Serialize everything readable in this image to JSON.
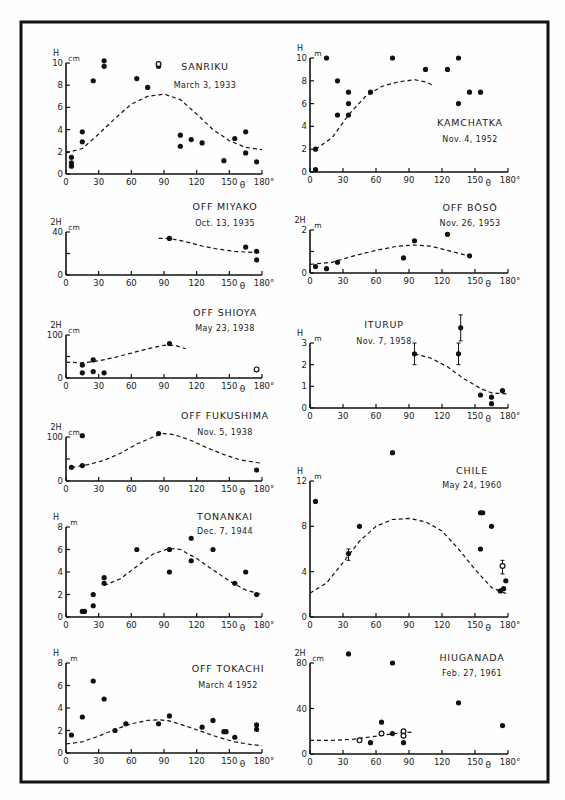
{
  "figure": {
    "frame": true,
    "x_axis_symbol": "θ",
    "x_ticks": [
      0,
      30,
      60,
      90,
      120,
      150,
      180
    ],
    "x_tick_labels": [
      "0",
      "30",
      "60",
      "90",
      "120",
      "150",
      "180°"
    ]
  },
  "chart_data": [
    {
      "type": "scatter",
      "title": "SANRIKU",
      "subtitle": "March 3, 1933",
      "ylabel": "H",
      "yunit": "cm",
      "xlabel": "θ",
      "xlim": [
        0,
        180
      ],
      "ylim": [
        0,
        10
      ],
      "yticks": [
        0,
        2,
        4,
        6,
        8,
        10
      ],
      "points": [
        [
          5,
          0.7
        ],
        [
          5,
          1
        ],
        [
          5,
          1.5
        ],
        [
          15,
          2.9
        ],
        [
          15,
          3.8
        ],
        [
          25,
          8.4
        ],
        [
          35,
          9.7
        ],
        [
          35,
          10.2
        ],
        [
          65,
          8.6
        ],
        [
          75,
          7.8
        ],
        [
          85,
          9.7
        ],
        [
          105,
          2.5
        ],
        [
          105,
          3.5
        ],
        [
          115,
          3.1
        ],
        [
          125,
          2.8
        ],
        [
          145,
          1.2
        ],
        [
          155,
          3.2
        ],
        [
          165,
          1.9
        ],
        [
          165,
          3.8
        ],
        [
          175,
          1.1
        ]
      ],
      "open_points": [
        [
          85,
          9.9
        ]
      ],
      "curve": [
        [
          0,
          1.9
        ],
        [
          15,
          2.3
        ],
        [
          30,
          3.6
        ],
        [
          45,
          5.0
        ],
        [
          60,
          6.3
        ],
        [
          75,
          7.0
        ],
        [
          90,
          7.2
        ],
        [
          105,
          6.7
        ],
        [
          120,
          5.4
        ],
        [
          135,
          4.0
        ],
        [
          150,
          3.0
        ],
        [
          165,
          2.4
        ],
        [
          180,
          2.2
        ]
      ]
    },
    {
      "type": "scatter",
      "title": "KAMCHATKA",
      "subtitle": "Nov. 4, 1952",
      "ylabel": "H",
      "yunit": "m",
      "xlabel": "θ",
      "xlim": [
        0,
        180
      ],
      "ylim": [
        0,
        10
      ],
      "yticks": [
        0,
        2,
        4,
        6,
        8,
        10
      ],
      "points": [
        [
          5,
          0.2
        ],
        [
          5,
          2
        ],
        [
          15,
          10
        ],
        [
          25,
          5
        ],
        [
          25,
          8
        ],
        [
          35,
          5
        ],
        [
          35,
          6
        ],
        [
          35,
          7
        ],
        [
          55,
          7
        ],
        [
          75,
          10
        ],
        [
          105,
          9
        ],
        [
          125,
          9
        ],
        [
          135,
          6
        ],
        [
          135,
          10
        ],
        [
          145,
          7
        ],
        [
          155,
          7
        ]
      ],
      "curve": [
        [
          5,
          2
        ],
        [
          20,
          3.0
        ],
        [
          35,
          5.0
        ],
        [
          50,
          6.6
        ],
        [
          65,
          7.5
        ],
        [
          80,
          7.9
        ],
        [
          95,
          8.1
        ],
        [
          105,
          7.9
        ],
        [
          112,
          7.6
        ]
      ]
    },
    {
      "type": "scatter",
      "title": "OFF MIYAKO",
      "subtitle": "Oct. 13, 1935",
      "ylabel": "2H",
      "yunit": "cm",
      "xlabel": "θ",
      "xlim": [
        0,
        180
      ],
      "ylim": [
        0,
        40
      ],
      "yticks": [
        0,
        20,
        40
      ],
      "ytick_labels": [
        "0",
        "",
        "40"
      ],
      "points": [
        [
          95,
          34
        ],
        [
          165,
          26
        ],
        [
          175,
          22
        ],
        [
          175,
          14
        ]
      ],
      "curve": [
        [
          85,
          34
        ],
        [
          95,
          34
        ],
        [
          110,
          31
        ],
        [
          125,
          27
        ],
        [
          140,
          24
        ],
        [
          155,
          22
        ],
        [
          170,
          21
        ],
        [
          180,
          21
        ]
      ]
    },
    {
      "type": "scatter",
      "title": "OFF BŌSŌ",
      "subtitle": "Nov. 26, 1953",
      "ylabel": "2H",
      "yunit": "m",
      "xlabel": "θ",
      "xlim": [
        0,
        180
      ],
      "ylim": [
        0,
        2
      ],
      "yticks": [
        0,
        1,
        2
      ],
      "ytick_labels": [
        "0",
        "",
        "2"
      ],
      "points": [
        [
          5,
          0.3
        ],
        [
          15,
          0.2
        ],
        [
          25,
          0.5
        ],
        [
          85,
          0.7
        ],
        [
          95,
          1.5
        ],
        [
          125,
          1.8
        ],
        [
          145,
          0.8
        ]
      ],
      "curve": [
        [
          0,
          0.4
        ],
        [
          20,
          0.5
        ],
        [
          40,
          0.8
        ],
        [
          60,
          1.05
        ],
        [
          80,
          1.25
        ],
        [
          95,
          1.3
        ],
        [
          110,
          1.25
        ],
        [
          125,
          1.05
        ],
        [
          140,
          0.85
        ],
        [
          145,
          0.8
        ]
      ]
    },
    {
      "type": "scatter",
      "title": "OFF SHIOYA",
      "subtitle": "May 23, 1938",
      "ylabel": "2H",
      "yunit": "cm",
      "xlabel": "θ",
      "xlim": [
        0,
        180
      ],
      "ylim": [
        0,
        100
      ],
      "yticks": [
        0,
        50,
        100
      ],
      "ytick_labels": [
        "0",
        "",
        "100"
      ],
      "points": [
        [
          15,
          12
        ],
        [
          15,
          30
        ],
        [
          25,
          42
        ],
        [
          25,
          15
        ],
        [
          35,
          12
        ],
        [
          95,
          80
        ]
      ],
      "open_points": [
        [
          175,
          20
        ]
      ],
      "curve": [
        [
          0,
          37
        ],
        [
          15,
          35
        ],
        [
          30,
          40
        ],
        [
          45,
          48
        ],
        [
          60,
          58
        ],
        [
          75,
          68
        ],
        [
          90,
          76
        ],
        [
          100,
          76
        ],
        [
          110,
          68
        ]
      ]
    },
    {
      "type": "scatter",
      "title": "ITURUP",
      "subtitle": "Nov. 7, 1958",
      "ylabel": "H",
      "yunit": "m",
      "xlabel": "θ",
      "xlim": [
        0,
        180
      ],
      "ylim": [
        0,
        3
      ],
      "yticks": [
        0,
        1,
        2,
        3
      ],
      "points": [
        [
          95,
          2.5
        ],
        [
          135,
          2.5
        ],
        [
          137,
          3.7
        ],
        [
          155,
          0.6
        ],
        [
          165,
          0.5
        ],
        [
          165,
          0.2
        ],
        [
          175,
          0.8
        ]
      ],
      "error_bars": [
        [
          95,
          2.0,
          3.0
        ],
        [
          135,
          2.0,
          3.0
        ],
        [
          137,
          3.1,
          4.3
        ]
      ],
      "curve": [
        [
          95,
          2.5
        ],
        [
          110,
          2.3
        ],
        [
          125,
          1.9
        ],
        [
          140,
          1.35
        ],
        [
          155,
          0.9
        ],
        [
          165,
          0.7
        ],
        [
          170,
          0.68
        ],
        [
          180,
          0.65
        ]
      ]
    },
    {
      "type": "scatter",
      "title": "OFF FUKUSHIMA",
      "subtitle": "Nov. 5, 1938",
      "ylabel": "2H",
      "yunit": "cm",
      "xlabel": "θ",
      "xlim": [
        0,
        180
      ],
      "ylim": [
        0,
        100
      ],
      "yticks": [
        0,
        50,
        100
      ],
      "ytick_labels": [
        "0",
        "",
        "100"
      ],
      "points": [
        [
          5,
          31
        ],
        [
          15,
          103
        ],
        [
          15,
          35
        ],
        [
          85,
          108
        ],
        [
          175,
          25
        ]
      ],
      "curve": [
        [
          5,
          31
        ],
        [
          20,
          37
        ],
        [
          35,
          47
        ],
        [
          50,
          63
        ],
        [
          65,
          84
        ],
        [
          80,
          100
        ],
        [
          90,
          108
        ],
        [
          100,
          105
        ],
        [
          115,
          92
        ],
        [
          130,
          75
        ],
        [
          145,
          60
        ],
        [
          160,
          48
        ],
        [
          175,
          42
        ],
        [
          180,
          41
        ]
      ]
    },
    {
      "type": "scatter",
      "title": "CHILE",
      "subtitle": "May 24, 1960",
      "ylabel": "H",
      "yunit": "m",
      "xlabel": "θ",
      "xlim": [
        0,
        180
      ],
      "ylim": [
        0,
        12
      ],
      "yticks": [
        0,
        4,
        8,
        12
      ],
      "points": [
        [
          5,
          10.2
        ],
        [
          35,
          5.6
        ],
        [
          45,
          8.0
        ],
        [
          75,
          14.5
        ],
        [
          155,
          9.2
        ],
        [
          157,
          9.2
        ],
        [
          155,
          6.0
        ],
        [
          165,
          8.0
        ],
        [
          173,
          2.3
        ],
        [
          176,
          2.5
        ],
        [
          178,
          3.2
        ]
      ],
      "open_points": [
        [
          175,
          4.5
        ]
      ],
      "error_bars": [
        [
          35,
          5.0,
          6.0
        ],
        [
          175,
          3.8,
          5.0
        ]
      ],
      "curve": [
        [
          0,
          2.1
        ],
        [
          15,
          3.0
        ],
        [
          30,
          4.8
        ],
        [
          45,
          6.7
        ],
        [
          60,
          8.0
        ],
        [
          75,
          8.6
        ],
        [
          90,
          8.7
        ],
        [
          105,
          8.4
        ],
        [
          120,
          7.6
        ],
        [
          135,
          6.0
        ],
        [
          150,
          4.2
        ],
        [
          165,
          2.6
        ],
        [
          175,
          2.2
        ],
        [
          180,
          2.0
        ]
      ]
    },
    {
      "type": "scatter",
      "title": "TONANKAI",
      "subtitle": "Dec. 7, 1944",
      "ylabel": "H",
      "yunit": "m",
      "xlabel": "θ",
      "xlim": [
        0,
        180
      ],
      "ylim": [
        0,
        8
      ],
      "yticks": [
        0,
        2,
        4,
        6,
        8
      ],
      "points": [
        [
          15,
          0.5
        ],
        [
          17,
          0.5
        ],
        [
          25,
          1
        ],
        [
          25,
          2
        ],
        [
          35,
          3
        ],
        [
          35,
          3.5
        ],
        [
          65,
          6
        ],
        [
          95,
          6
        ],
        [
          95,
          4
        ],
        [
          115,
          7
        ],
        [
          115,
          5
        ],
        [
          135,
          6
        ],
        [
          155,
          3
        ],
        [
          165,
          4
        ],
        [
          175,
          2
        ]
      ],
      "curve": [
        [
          35,
          2.8
        ],
        [
          50,
          3.4
        ],
        [
          65,
          4.5
        ],
        [
          80,
          5.6
        ],
        [
          95,
          6.1
        ],
        [
          105,
          6.0
        ],
        [
          120,
          5.2
        ],
        [
          135,
          4.2
        ],
        [
          150,
          3.2
        ],
        [
          165,
          2.4
        ],
        [
          180,
          2.0
        ]
      ]
    },
    {
      "type": "scatter",
      "title": "OFF TOKACHI",
      "subtitle": "March 4 1952",
      "ylabel": "H",
      "yunit": "m",
      "xlabel": "θ",
      "xlim": [
        0,
        180
      ],
      "ylim": [
        0,
        8
      ],
      "yticks": [
        0,
        2,
        4,
        6,
        8
      ],
      "points": [
        [
          5,
          1.6
        ],
        [
          15,
          3.2
        ],
        [
          25,
          6.4
        ],
        [
          35,
          4.8
        ],
        [
          45,
          2.0
        ],
        [
          55,
          2.6
        ],
        [
          85,
          2.6
        ],
        [
          95,
          3.3
        ],
        [
          125,
          2.3
        ],
        [
          135,
          2.9
        ],
        [
          145,
          1.9
        ],
        [
          147,
          1.9
        ],
        [
          155,
          1.4
        ],
        [
          175,
          2.1
        ],
        [
          175,
          2.5
        ]
      ],
      "curve": [
        [
          0,
          0.8
        ],
        [
          15,
          1.0
        ],
        [
          30,
          1.5
        ],
        [
          45,
          2.1
        ],
        [
          60,
          2.6
        ],
        [
          75,
          2.9
        ],
        [
          85,
          2.95
        ],
        [
          95,
          2.85
        ],
        [
          110,
          2.4
        ],
        [
          125,
          1.9
        ],
        [
          140,
          1.4
        ],
        [
          155,
          1.0
        ],
        [
          170,
          0.75
        ],
        [
          180,
          0.65
        ]
      ]
    },
    {
      "type": "scatter",
      "title": "HIUGANADA",
      "subtitle": "Feb. 27, 1961",
      "ylabel": "2H",
      "yunit": "cm",
      "xlabel": "θ",
      "xlim": [
        0,
        180
      ],
      "ylim": [
        0,
        80
      ],
      "yticks": [
        0,
        40,
        80
      ],
      "points": [
        [
          35,
          88
        ],
        [
          55,
          10
        ],
        [
          65,
          28
        ],
        [
          75,
          80
        ],
        [
          75,
          18
        ],
        [
          85,
          10
        ],
        [
          135,
          45
        ],
        [
          175,
          25
        ]
      ],
      "open_points": [
        [
          45,
          12
        ],
        [
          65,
          18
        ],
        [
          85,
          20
        ],
        [
          85,
          16
        ]
      ],
      "curve": [
        [
          0,
          12
        ],
        [
          20,
          12
        ],
        [
          40,
          13
        ],
        [
          55,
          15
        ],
        [
          70,
          17
        ],
        [
          85,
          19
        ],
        [
          95,
          19
        ]
      ]
    }
  ]
}
